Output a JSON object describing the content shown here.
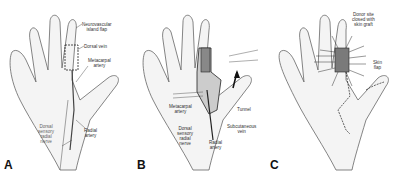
{
  "figure": {
    "panels": [
      {
        "id": "A",
        "letter": "A",
        "labels": {
          "flap": "Neurovascular\nisland flap",
          "vein": "Dorsal vein",
          "metacarpal": "Metacarpal\nartery",
          "nerve": "Dorsal\nsensory\nradial\nnerve",
          "radial": "Radial\nartery"
        }
      },
      {
        "id": "B",
        "letter": "B",
        "labels": {
          "metacarpal": "Metacarpal\nartery",
          "tunnel": "Tunnel",
          "nerve": "Dorsal\nsensory\nradial\nnerve",
          "subq": "Subcutaneous\nvein",
          "radial": "Radial\nartery"
        }
      },
      {
        "id": "C",
        "letter": "C",
        "labels": {
          "donor": "Donor site\nclosed with\nskin graft",
          "skinflap": "Skin\nflap"
        }
      }
    ],
    "colors": {
      "line": "#555555",
      "skin": "#f2f2f2",
      "graft": "#7a7a7a"
    }
  }
}
